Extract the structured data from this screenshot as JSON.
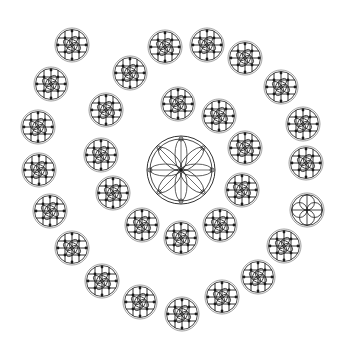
{
  "puzzle": {
    "title": "",
    "stroke_color": "#1a1a1a",
    "ring_color": "#888888",
    "center": {
      "x": 181,
      "y": 170,
      "r": 34,
      "pattern": "eight-petal-rosette"
    },
    "tiles": [
      {
        "x": 72,
        "y": 45,
        "pattern": "cross-quatrefoil"
      },
      {
        "x": 165,
        "y": 47,
        "pattern": "cross-quatrefoil"
      },
      {
        "x": 207,
        "y": 45,
        "pattern": "cross-quatrefoil"
      },
      {
        "x": 245,
        "y": 58,
        "pattern": "cross-quatrefoil"
      },
      {
        "x": 281,
        "y": 87,
        "pattern": "cross-quatrefoil"
      },
      {
        "x": 303,
        "y": 124,
        "pattern": "cross-quatrefoil"
      },
      {
        "x": 306,
        "y": 163,
        "pattern": "cross-quatrefoil"
      },
      {
        "x": 307,
        "y": 210,
        "pattern": "four-petal-flower"
      },
      {
        "x": 284,
        "y": 246,
        "pattern": "cross-quatrefoil"
      },
      {
        "x": 258,
        "y": 277,
        "pattern": "cross-quatrefoil"
      },
      {
        "x": 222,
        "y": 297,
        "pattern": "cross-quatrefoil"
      },
      {
        "x": 182,
        "y": 314,
        "pattern": "cross-quatrefoil"
      },
      {
        "x": 140,
        "y": 302,
        "pattern": "cross-quatrefoil"
      },
      {
        "x": 102,
        "y": 281,
        "pattern": "cross-quatrefoil"
      },
      {
        "x": 72,
        "y": 248,
        "pattern": "cross-quatrefoil"
      },
      {
        "x": 50,
        "y": 211,
        "pattern": "cross-quatrefoil"
      },
      {
        "x": 39,
        "y": 170,
        "pattern": "cross-quatrefoil"
      },
      {
        "x": 38,
        "y": 127,
        "pattern": "cross-quatrefoil"
      },
      {
        "x": 51,
        "y": 84,
        "pattern": "cross-quatrefoil"
      },
      {
        "x": 130,
        "y": 73,
        "pattern": "cross-quatrefoil"
      },
      {
        "x": 106,
        "y": 110,
        "pattern": "cross-quatrefoil"
      },
      {
        "x": 101,
        "y": 155,
        "pattern": "cross-quatrefoil"
      },
      {
        "x": 113,
        "y": 193,
        "pattern": "cross-quatrefoil"
      },
      {
        "x": 142,
        "y": 225,
        "pattern": "cross-quatrefoil"
      },
      {
        "x": 181,
        "y": 238,
        "pattern": "cross-quatrefoil"
      },
      {
        "x": 220,
        "y": 225,
        "pattern": "cross-quatrefoil"
      },
      {
        "x": 242,
        "y": 190,
        "pattern": "cross-quatrefoil"
      },
      {
        "x": 245,
        "y": 148,
        "pattern": "cross-quatrefoil"
      },
      {
        "x": 219,
        "y": 116,
        "pattern": "cross-quatrefoil"
      },
      {
        "x": 178,
        "y": 104,
        "pattern": "cross-quatrefoil"
      }
    ]
  }
}
